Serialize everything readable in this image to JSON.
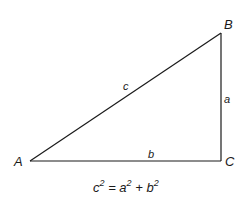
{
  "diagram": {
    "type": "right-triangle",
    "stroke_color": "#1a1a1a",
    "vertices": [
      {
        "label": "A",
        "x": 30,
        "y": 161
      },
      {
        "label": "B",
        "x": 221,
        "y": 33
      },
      {
        "label": "C",
        "x": 221,
        "y": 161
      }
    ],
    "sides": {
      "hypotenuse": {
        "label": "c",
        "from": "A",
        "to": "B"
      },
      "vertical": {
        "label": "a",
        "from": "B",
        "to": "C"
      },
      "base": {
        "label": "b",
        "from": "A",
        "to": "C"
      }
    },
    "right_angle_at": "C",
    "formula": {
      "lhs_base": "c",
      "lhs_exp": "2",
      "eq": " = ",
      "t1_base": "a",
      "t1_exp": "2",
      "plus": " + ",
      "t2_base": "b",
      "t2_exp": "2",
      "text": "c² = a² + b²"
    }
  }
}
